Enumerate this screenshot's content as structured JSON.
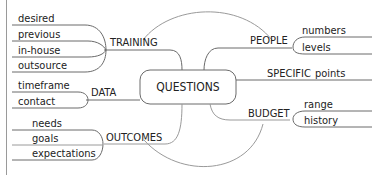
{
  "diagram": {
    "type": "mind-map",
    "center": {
      "label": "QUESTIONS"
    },
    "branches": [
      {
        "label": "TRAINING",
        "side": "left",
        "children": [
          "desired",
          "previous",
          "in-house",
          "outsource"
        ]
      },
      {
        "label": "DATA",
        "side": "left",
        "children": [
          "timeframe",
          "contact"
        ]
      },
      {
        "label": "OUTCOMES",
        "side": "left",
        "children": [
          "needs",
          "goals",
          "expectations"
        ]
      },
      {
        "label": "PEOPLE",
        "side": "right",
        "children": [
          "numbers",
          "levels"
        ]
      },
      {
        "label": "SPECIFIC",
        "side": "right",
        "children": [
          "points"
        ]
      },
      {
        "label": "BUDGET",
        "side": "right",
        "children": [
          "range",
          "history"
        ]
      }
    ]
  },
  "colors": {
    "line": "#6a6a6a",
    "text": "#222222",
    "background": "#ffffff"
  }
}
